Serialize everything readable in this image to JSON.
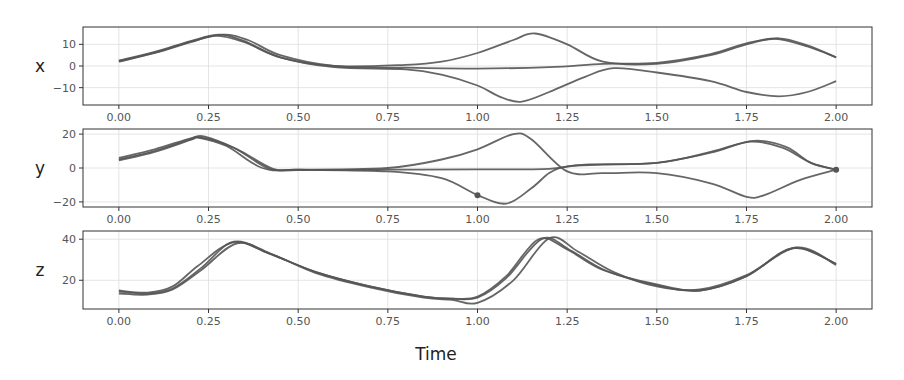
{
  "chart_data": {
    "type": "line",
    "title": "",
    "xlabel": "Time",
    "x_ticks": [
      "0.00",
      "0.25",
      "0.50",
      "0.75",
      "1.00",
      "1.25",
      "1.50",
      "1.75",
      "2.00"
    ],
    "x_tick_values": [
      0,
      0.25,
      0.5,
      0.75,
      1.0,
      1.25,
      1.5,
      1.75,
      2.0
    ],
    "xlim": [
      -0.1,
      2.1
    ],
    "grid": true,
    "legend": null,
    "line_color": "#555555",
    "panels": [
      {
        "ylabel": "x",
        "ylim": [
          -18,
          18
        ],
        "y_ticks": [
          "10",
          "0",
          "−10"
        ],
        "y_tick_values": [
          10,
          0,
          -10
        ],
        "series": [
          {
            "name": "x-trajectory-1",
            "x": [
              0,
              0.1,
              0.2,
              0.27,
              0.35,
              0.45,
              0.6,
              0.8,
              0.9,
              1.0,
              1.1,
              1.16,
              1.25,
              1.35,
              1.5,
              1.65,
              1.75,
              1.83,
              1.92,
              2.0
            ],
            "y": [
              2,
              6,
              11,
              14,
              11,
              4,
              0,
              0.5,
              2,
              6,
              12,
              15,
              10,
              2,
              1,
              5,
              10,
              12.5,
              9,
              4
            ]
          },
          {
            "name": "x-trajectory-2",
            "x": [
              0,
              0.1,
              0.2,
              0.28,
              0.35,
              0.45,
              0.6,
              0.8,
              0.9,
              1.0,
              1.06,
              1.12,
              1.2,
              1.3,
              1.38,
              1.5,
              1.65,
              1.75,
              1.84,
              1.92,
              2.0
            ],
            "y": [
              2.5,
              6.5,
              11.5,
              14.5,
              11.5,
              4,
              -0.5,
              -1.5,
              -4,
              -9,
              -14,
              -16.5,
              -12,
              -5,
              -1,
              -3,
              -7,
              -12,
              -14,
              -12,
              -7
            ]
          },
          {
            "name": "x-trajectory-3",
            "x": [
              0,
              0.1,
              0.2,
              0.29,
              0.36,
              0.45,
              0.6,
              0.8,
              1.0,
              1.2,
              1.35,
              1.5,
              1.65,
              1.75,
              1.84,
              1.92,
              2.0
            ],
            "y": [
              2.2,
              6.2,
              11.2,
              14.5,
              12,
              5,
              0,
              -0.8,
              -1.2,
              -0.5,
              1,
              1.5,
              5.5,
              10.5,
              12.8,
              9.5,
              4
            ]
          }
        ],
        "markers": []
      },
      {
        "ylabel": "y",
        "ylim": [
          -23,
          23
        ],
        "y_ticks": [
          "20",
          "0",
          "−20"
        ],
        "y_tick_values": [
          20,
          0,
          -20
        ],
        "series": [
          {
            "name": "y-trajectory-1",
            "x": [
              0,
              0.1,
              0.2,
              0.22,
              0.3,
              0.4,
              0.5,
              0.75,
              0.9,
              1.0,
              1.1,
              1.15,
              1.25,
              1.35,
              1.5,
              1.65,
              1.75,
              1.8,
              1.9,
              2.0
            ],
            "y": [
              5,
              10,
              17,
              18,
              13,
              0,
              -1,
              0,
              5,
              11,
              20,
              17,
              -2,
              -3,
              -3,
              -9,
              -17,
              -16,
              -7,
              -1
            ]
          },
          {
            "name": "y-trajectory-2",
            "x": [
              0,
              0.1,
              0.2,
              0.23,
              0.32,
              0.42,
              0.5,
              0.75,
              0.9,
              1.0,
              1.08,
              1.15,
              1.2,
              1.25,
              1.35,
              1.5,
              1.65,
              1.76,
              1.85,
              1.93,
              2.0
            ],
            "y": [
              4.5,
              9.5,
              16.5,
              18,
              12,
              -0.5,
              -1,
              -2,
              -6,
              -16,
              -21,
              -12,
              -3,
              1,
              2,
              3,
              9,
              15.5,
              12,
              3,
              -1
            ]
          },
          {
            "name": "y-trajectory-3",
            "x": [
              0,
              0.1,
              0.2,
              0.24,
              0.33,
              0.43,
              0.5,
              0.75,
              1.0,
              1.2,
              1.3,
              1.5,
              1.65,
              1.77,
              1.86,
              1.93,
              2.0
            ],
            "y": [
              6,
              11,
              17.5,
              18.5,
              11,
              -0.5,
              -1.2,
              -1,
              -0.8,
              -0.5,
              2,
              3,
              9.5,
              16,
              12.5,
              3,
              -1
            ]
          }
        ],
        "markers": [
          {
            "x": 1.0,
            "y": -16
          },
          {
            "x": 2.0,
            "y": -1
          }
        ]
      },
      {
        "ylabel": "z",
        "ylim": [
          6,
          44
        ],
        "y_ticks": [
          "40",
          "20"
        ],
        "y_tick_values": [
          40,
          20
        ],
        "series": [
          {
            "name": "z-trajectory-1",
            "x": [
              0,
              0.08,
              0.15,
              0.22,
              0.32,
              0.42,
              0.55,
              0.7,
              0.85,
              0.93,
              1.0,
              1.08,
              1.17,
              1.25,
              1.35,
              1.5,
              1.62,
              1.75,
              1.88,
              2.0
            ],
            "y": [
              15,
              14,
              17,
              27,
              38.5,
              33,
              24,
              17,
              12,
              11,
              12,
              22,
              40,
              35,
              25,
              18,
              15,
              22,
              35.5,
              28
            ]
          },
          {
            "name": "z-trajectory-2",
            "x": [
              0,
              0.08,
              0.15,
              0.23,
              0.33,
              0.43,
              0.55,
              0.7,
              0.85,
              0.93,
              1.0,
              1.1,
              1.2,
              1.28,
              1.38,
              1.5,
              1.62,
              1.75,
              1.89,
              2.0
            ],
            "y": [
              13.5,
              13,
              15.5,
              25,
              38,
              32.5,
              23.5,
              16.5,
              11.5,
              10.5,
              9,
              20,
              40.5,
              34,
              24,
              17,
              15.5,
              22.5,
              36,
              27.5
            ]
          },
          {
            "name": "z-trajectory-3",
            "x": [
              0,
              0.08,
              0.15,
              0.23,
              0.32,
              0.42,
              0.55,
              0.7,
              0.85,
              0.93,
              1.0,
              1.08,
              1.18,
              1.26,
              1.36,
              1.5,
              1.62,
              1.75,
              1.88,
              2.0
            ],
            "y": [
              14.5,
              13.5,
              16,
              26,
              38.8,
              33,
              24,
              17,
              12,
              11,
              11.5,
              21,
              40.2,
              34.5,
              24.5,
              17.5,
              15,
              22,
              35.8,
              28
            ]
          }
        ],
        "markers": []
      }
    ]
  }
}
